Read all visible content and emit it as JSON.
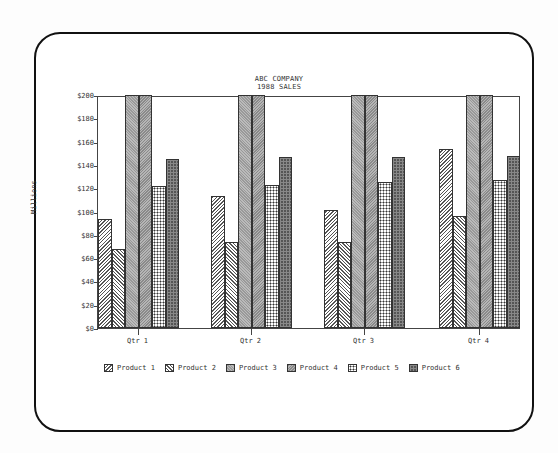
{
  "chart_data": {
    "type": "bar",
    "title": "ABC COMPANY",
    "subtitle": "1988 SALES",
    "xlabel": "",
    "ylabel": "Millions",
    "ylim": [
      0,
      200
    ],
    "yticks": [
      "$0",
      "$20",
      "$40",
      "$60",
      "$80",
      "$100",
      "$120",
      "$140",
      "$160",
      "$180",
      "$200"
    ],
    "categories": [
      "Qtr 1",
      "Qtr 2",
      "Qtr 3",
      "Qtr 4"
    ],
    "series": [
      {
        "name": "Product 1",
        "values": [
          94,
          113,
          101,
          154
        ]
      },
      {
        "name": "Product 2",
        "values": [
          68,
          74,
          74,
          96
        ]
      },
      {
        "name": "Product 3",
        "values": [
          200,
          200,
          200,
          200
        ]
      },
      {
        "name": "Product 4",
        "values": [
          200,
          200,
          200,
          200
        ]
      },
      {
        "name": "Product 5",
        "values": [
          122,
          123,
          125,
          127
        ]
      },
      {
        "name": "Product 6",
        "values": [
          145,
          147,
          147,
          148
        ]
      }
    ],
    "grid": false,
    "legend_position": "bottom"
  }
}
